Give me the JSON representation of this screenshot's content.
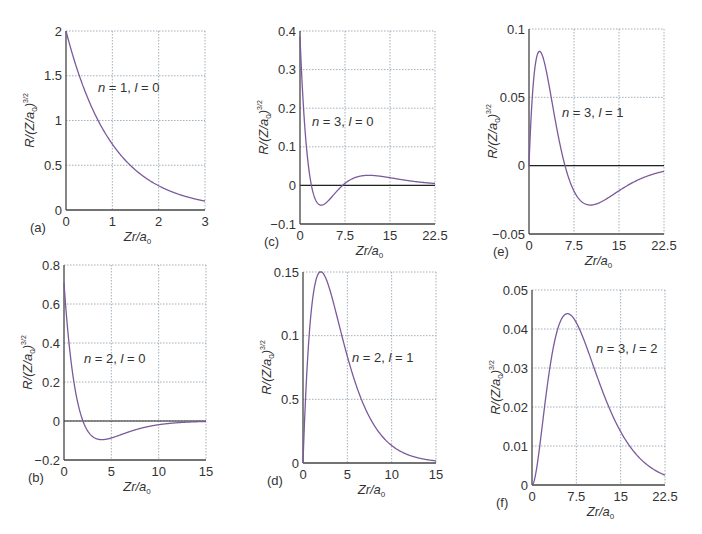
{
  "chart_data": [
    {
      "id": "a",
      "panel_label": "(a)",
      "type": "line",
      "annotation": "n = 1, l = 0",
      "n": 1,
      "l": 0,
      "xlabel": "Zr/a0",
      "ylabel": "R/(Z/a0)^3/2",
      "xlim": [
        0,
        3
      ],
      "ylim": [
        0,
        2
      ],
      "xticks": [
        0,
        1,
        2,
        3
      ],
      "xtick_labels": [
        "0",
        "1",
        "2",
        "3"
      ],
      "yticks": [
        0,
        0.5,
        1,
        1.5,
        2
      ],
      "ytick_labels": [
        "0",
        "0.5",
        "1",
        "1.5",
        "2"
      ],
      "grid": true,
      "points": {
        "x": [
          0,
          0.5,
          1,
          1.5,
          2,
          2.5,
          3
        ],
        "y": [
          2.0,
          1.21,
          0.74,
          0.45,
          0.27,
          0.16,
          0.1
        ]
      },
      "box": {
        "left": 66,
        "top": 31,
        "right": 205,
        "bottom": 210
      },
      "ann_pos": {
        "x": 98,
        "y": 92
      }
    },
    {
      "id": "b",
      "panel_label": "(b)",
      "type": "line",
      "annotation": "n = 2, l = 0",
      "n": 2,
      "l": 0,
      "xlabel": "Zr/a0",
      "ylabel": "R/(Z/a0)^3/2",
      "xlim": [
        0,
        15
      ],
      "ylim": [
        -0.2,
        0.8
      ],
      "xticks": [
        0,
        5,
        10,
        15
      ],
      "xtick_labels": [
        "0",
        "5",
        "10",
        "15"
      ],
      "yticks": [
        -0.2,
        0,
        0.2,
        0.4,
        0.6,
        0.8
      ],
      "ytick_labels": [
        "-0.2",
        "0",
        "0.2",
        "0.4",
        "0.6",
        "0.8"
      ],
      "grid": true,
      "points": {
        "x": [
          0,
          1,
          2,
          4,
          6,
          10,
          15
        ],
        "y": [
          0.71,
          0.21,
          0.0,
          -0.096,
          -0.07,
          -0.019,
          -0.002
        ]
      },
      "box": {
        "left": 64,
        "top": 265,
        "right": 206,
        "bottom": 460
      },
      "ann_pos": {
        "x": 84,
        "y": 363
      }
    },
    {
      "id": "c",
      "panel_label": "(c)",
      "type": "line",
      "annotation": "n = 3, l = 0",
      "n": 3,
      "l": 0,
      "xlabel": "Zr/a0",
      "ylabel": "R/(Z/a0)^3/2",
      "xlim": [
        0,
        22.5
      ],
      "ylim": [
        -0.1,
        0.4
      ],
      "xticks": [
        0,
        7.5,
        15,
        22.5
      ],
      "xtick_labels": [
        "0",
        "7.5",
        "15",
        "22.5"
      ],
      "yticks": [
        -0.1,
        0,
        0.1,
        0.2,
        0.3,
        0.4
      ],
      "ytick_labels": [
        "-0.1",
        "0",
        "0.1",
        "0.2",
        "0.3",
        "0.4"
      ],
      "grid": true,
      "points": {
        "x": [
          0,
          1.9,
          3.5,
          7.1,
          11,
          15,
          22.5
        ],
        "y": [
          0.385,
          0.0,
          -0.055,
          0.0,
          0.025,
          0.017,
          0.005
        ]
      },
      "box": {
        "left": 300,
        "top": 31,
        "right": 435,
        "bottom": 224
      },
      "ann_pos": {
        "x": 312,
        "y": 126
      }
    },
    {
      "id": "d",
      "panel_label": "(d)",
      "type": "line",
      "annotation": "n = 2, l = 1",
      "n": 2,
      "l": 1,
      "xlabel": "Zr/a0",
      "ylabel": "R/(Z/a0)^3/2",
      "xlim": [
        0,
        15
      ],
      "ylim": [
        0,
        0.15
      ],
      "xticks": [
        0,
        5,
        10,
        15
      ],
      "xtick_labels": [
        "0",
        "5",
        "10",
        "15"
      ],
      "yticks": [
        0,
        0.05,
        0.1,
        0.15
      ],
      "ytick_labels": [
        "0",
        "0.5",
        "0.1",
        "0.15"
      ],
      "grid": true,
      "points": {
        "x": [
          0,
          2,
          4,
          6,
          8,
          10,
          15
        ],
        "y": [
          0.0,
          0.15,
          0.11,
          0.061,
          0.03,
          0.014,
          0.001
        ]
      },
      "box": {
        "left": 303,
        "top": 272,
        "right": 436,
        "bottom": 463
      },
      "ann_pos": {
        "x": 352,
        "y": 362
      }
    },
    {
      "id": "e",
      "panel_label": "(e)",
      "type": "line",
      "annotation": "n = 3, l = 1",
      "n": 3,
      "l": 1,
      "xlabel": "Zr/a0",
      "ylabel": "R/(Z/a0)^3/2",
      "xlim": [
        0,
        22.5
      ],
      "ylim": [
        -0.05,
        0.1
      ],
      "xticks": [
        0,
        7.5,
        15,
        22.5
      ],
      "xtick_labels": [
        "0",
        "7.5",
        "15",
        "22.5"
      ],
      "yticks": [
        -0.05,
        0,
        0.05,
        0.1
      ],
      "ytick_labels": [
        "-0.05",
        "0",
        "0.05",
        "0.1"
      ],
      "grid": true,
      "points": {
        "x": [
          0,
          1.3,
          6,
          9.5,
          15,
          22.5
        ],
        "y": [
          0.0,
          0.075,
          0.0,
          -0.021,
          -0.012,
          -0.002
        ]
      },
      "box": {
        "left": 529,
        "top": 29,
        "right": 664,
        "bottom": 234
      },
      "ann_pos": {
        "x": 562,
        "y": 117
      }
    },
    {
      "id": "f",
      "panel_label": "(f)",
      "type": "line",
      "annotation": "n = 3, l = 2",
      "n": 3,
      "l": 2,
      "xlabel": "Zr/a0",
      "ylabel": "R/(Z/a0)^3/2",
      "xlim": [
        0,
        22.5
      ],
      "ylim": [
        0,
        0.05
      ],
      "xticks": [
        0,
        7.5,
        15,
        22.5
      ],
      "xtick_labels": [
        "0",
        "7.5",
        "15",
        "22.5"
      ],
      "yticks": [
        0,
        0.01,
        0.02,
        0.03,
        0.04,
        0.05
      ],
      "ytick_labels": [
        "0",
        "0.01",
        "0.02",
        "0.03",
        "0.04",
        "0.05"
      ],
      "grid": true,
      "points": {
        "x": [
          0,
          3,
          6,
          10,
          15,
          22.5
        ],
        "y": [
          0.0,
          0.027,
          0.045,
          0.036,
          0.016,
          0.003
        ]
      },
      "box": {
        "left": 532,
        "top": 290,
        "right": 665,
        "bottom": 485
      },
      "ann_pos": {
        "x": 596,
        "y": 353
      }
    }
  ],
  "colors": {
    "curve": "#7b5a9c",
    "axis": "#444444",
    "grid": "#8a9aa8",
    "zero_line": "#222222"
  }
}
